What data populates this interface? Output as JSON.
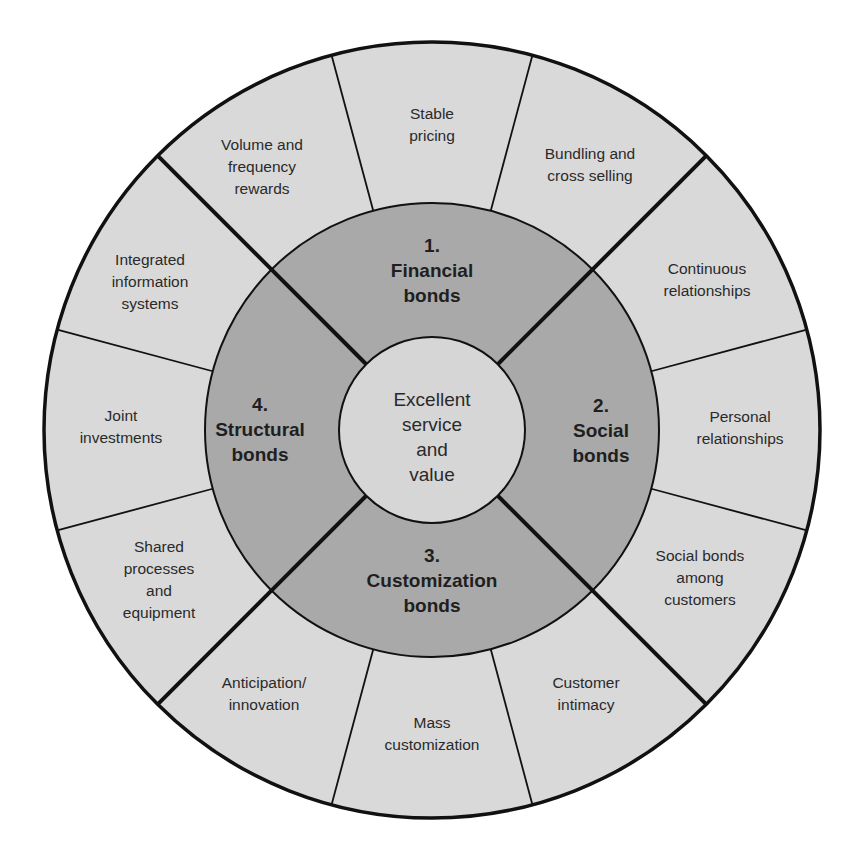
{
  "diagram": {
    "type": "concentric-wheel",
    "colors": {
      "outer_ring": "#d9d9d9",
      "middle_ring": "#a9a9a9",
      "center_circle": "#d6d6d6",
      "lines": "#111111",
      "text": "#2a2a2a"
    },
    "center": {
      "lines": [
        "Excellent",
        "service",
        "and",
        "value"
      ]
    },
    "bonds": [
      {
        "number": "1.",
        "lines": [
          "Financial",
          "bonds"
        ]
      },
      {
        "number": "2.",
        "lines": [
          "Social",
          "bonds"
        ]
      },
      {
        "number": "3.",
        "lines": [
          "Customization",
          "bonds"
        ]
      },
      {
        "number": "4.",
        "lines": [
          "Structural",
          "bonds"
        ]
      }
    ],
    "segments": [
      {
        "group": "Financial bonds",
        "lines": [
          "Stable",
          "pricing"
        ]
      },
      {
        "group": "Financial bonds",
        "lines": [
          "Bundling and",
          "cross selling"
        ]
      },
      {
        "group": "Social bonds",
        "lines": [
          "Continuous",
          "relationships"
        ]
      },
      {
        "group": "Social bonds",
        "lines": [
          "Personal",
          "relationships"
        ]
      },
      {
        "group": "Social bonds",
        "lines": [
          "Social bonds",
          "among",
          "customers"
        ]
      },
      {
        "group": "Customization bonds",
        "lines": [
          "Customer",
          "intimacy"
        ]
      },
      {
        "group": "Customization bonds",
        "lines": [
          "Mass",
          "customization"
        ]
      },
      {
        "group": "Customization bonds",
        "lines": [
          "Anticipation/",
          "innovation"
        ]
      },
      {
        "group": "Structural bonds",
        "lines": [
          "Shared",
          "processes",
          "and",
          "equipment"
        ]
      },
      {
        "group": "Structural bonds",
        "lines": [
          "Joint",
          "investments"
        ]
      },
      {
        "group": "Structural bonds",
        "lines": [
          "Integrated",
          "information",
          "systems"
        ]
      },
      {
        "group": "Financial bonds",
        "lines": [
          "Volume and",
          "frequency",
          "rewards"
        ]
      }
    ]
  }
}
